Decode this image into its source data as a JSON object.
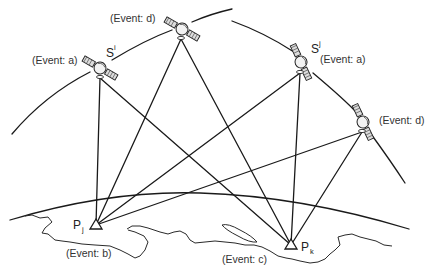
{
  "satellites": [
    {
      "id": "sat-a-left",
      "event_label": "(Event: a)",
      "symbol": "S",
      "superscript": "i"
    },
    {
      "id": "sat-d-top",
      "event_label": "(Event: d)",
      "symbol": "",
      "superscript": ""
    },
    {
      "id": "sat-a-right",
      "event_label": "(Event: a)",
      "symbol": "S",
      "superscript": "j"
    },
    {
      "id": "sat-d-right",
      "event_label": "(Event: d)",
      "symbol": "",
      "superscript": ""
    }
  ],
  "stations": [
    {
      "id": "station-pj",
      "symbol": "P",
      "subscript": "j",
      "event_label": "(Event: b)"
    },
    {
      "id": "station-pk",
      "symbol": "P",
      "subscript": "k",
      "event_label": "(Event: c)"
    }
  ],
  "links": [
    {
      "from": "sat-a-left",
      "to": "station-pj"
    },
    {
      "from": "sat-a-left",
      "to": "station-pk"
    },
    {
      "from": "sat-d-top",
      "to": "station-pj"
    },
    {
      "from": "sat-d-top",
      "to": "station-pk"
    },
    {
      "from": "sat-a-right",
      "to": "station-pj"
    },
    {
      "from": "sat-a-right",
      "to": "station-pk"
    },
    {
      "from": "sat-d-right",
      "to": "station-pj"
    },
    {
      "from": "sat-d-right",
      "to": "station-pk"
    }
  ],
  "colors": {
    "line": "#1a1a1a",
    "text": "#333333",
    "background": "#ffffff"
  }
}
